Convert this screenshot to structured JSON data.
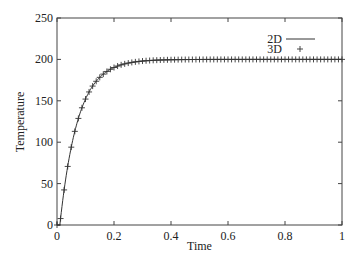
{
  "chart_data": {
    "type": "line",
    "title": "",
    "xlabel": "Time",
    "ylabel": "Temperature",
    "xlim": [
      0,
      1
    ],
    "ylim": [
      0,
      250
    ],
    "xticks": [
      0,
      0.2,
      0.4,
      0.6,
      0.8,
      1
    ],
    "xtick_labels": [
      "0",
      "0.2",
      "0.4",
      "0.6",
      "0.8",
      "1"
    ],
    "yticks": [
      0,
      50,
      100,
      150,
      200,
      250
    ],
    "ytick_labels": [
      "0",
      "50",
      "100",
      "150",
      "200",
      "250"
    ],
    "grid": false,
    "legend_position": "upper right",
    "model": {
      "asymptote": 200,
      "t0": 0.01,
      "tau": 0.063,
      "sample_step": 0.0125
    },
    "series": [
      {
        "name": "2D",
        "style": "line",
        "color": "#333333"
      },
      {
        "name": "3D",
        "style": "plus-markers",
        "color": "#333333"
      }
    ]
  },
  "legend": {
    "items": [
      {
        "label": "2D",
        "symbol": "line"
      },
      {
        "label": "3D",
        "symbol": "+"
      }
    ]
  }
}
